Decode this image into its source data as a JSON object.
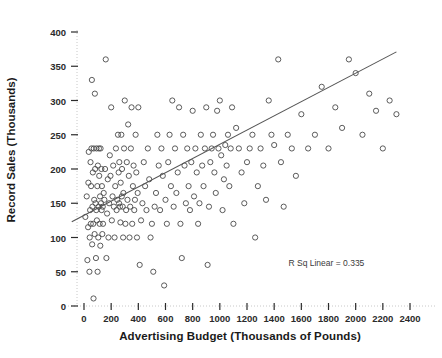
{
  "chart_data": {
    "type": "scatter",
    "title": "",
    "xlabel": "Advertising Budget (Thousands of Pounds)",
    "ylabel": "Record Sales (Thousands)",
    "xlim": [
      -120,
      2520
    ],
    "ylim": [
      -12,
      425
    ],
    "xticks": [
      0,
      200,
      400,
      600,
      800,
      1000,
      1200,
      1400,
      1600,
      1800,
      2000,
      2200,
      2400
    ],
    "yticks": [
      0,
      50,
      100,
      150,
      200,
      250,
      300,
      350,
      400
    ],
    "xtick_labels": [
      "0",
      "200",
      "400",
      "600",
      "800",
      "1000",
      "1200",
      "1400",
      "1600",
      "1800",
      "2000",
      "2200",
      "2400"
    ],
    "ytick_labels": [
      "0",
      "50",
      "100",
      "150",
      "200",
      "250",
      "300",
      "350",
      "400"
    ],
    "grid": false,
    "axis_line_style": "dotted",
    "legend": "none",
    "marker": "open-circle",
    "marker_color": "#4a4a4a",
    "marker_size": 4,
    "annotations": [
      {
        "text": "R Sq Linear = 0.335",
        "x": 1800,
        "y": 62
      }
    ],
    "fit_line": {
      "type": "linear",
      "r_squared": 0.335,
      "intercept": 134,
      "slope": 0.096,
      "x_start": -90,
      "y_start": 123,
      "x_end": 2300,
      "y_end": 371,
      "color": "#555555"
    },
    "points": [
      [
        10,
        130
      ],
      [
        20,
        160
      ],
      [
        25,
        67
      ],
      [
        30,
        115
      ],
      [
        32,
        180
      ],
      [
        35,
        225
      ],
      [
        40,
        50
      ],
      [
        42,
        100
      ],
      [
        45,
        140
      ],
      [
        48,
        210
      ],
      [
        50,
        120
      ],
      [
        52,
        175
      ],
      [
        55,
        230
      ],
      [
        58,
        330
      ],
      [
        60,
        90
      ],
      [
        62,
        145
      ],
      [
        65,
        195
      ],
      [
        68,
        120
      ],
      [
        70,
        11
      ],
      [
        72,
        230
      ],
      [
        75,
        155
      ],
      [
        78,
        105
      ],
      [
        80,
        310
      ],
      [
        82,
        200
      ],
      [
        85,
        150
      ],
      [
        88,
        70
      ],
      [
        90,
        140
      ],
      [
        92,
        230
      ],
      [
        95,
        125
      ],
      [
        98,
        175
      ],
      [
        100,
        50
      ],
      [
        102,
        205
      ],
      [
        105,
        100
      ],
      [
        108,
        145
      ],
      [
        110,
        230
      ],
      [
        112,
        190
      ],
      [
        115,
        120
      ],
      [
        118,
        160
      ],
      [
        120,
        88
      ],
      [
        122,
        230
      ],
      [
        125,
        150
      ],
      [
        128,
        200
      ],
      [
        130,
        140
      ],
      [
        132,
        175
      ],
      [
        135,
        105
      ],
      [
        138,
        145
      ],
      [
        140,
        120
      ],
      [
        145,
        165
      ],
      [
        150,
        155
      ],
      [
        155,
        200
      ],
      [
        160,
        360
      ],
      [
        165,
        70
      ],
      [
        170,
        135
      ],
      [
        175,
        185
      ],
      [
        180,
        100
      ],
      [
        185,
        150
      ],
      [
        190,
        220
      ],
      [
        195,
        190
      ],
      [
        200,
        290
      ],
      [
        205,
        125
      ],
      [
        210,
        160
      ],
      [
        215,
        205
      ],
      [
        220,
        145
      ],
      [
        225,
        100
      ],
      [
        230,
        175
      ],
      [
        235,
        230
      ],
      [
        240,
        140
      ],
      [
        245,
        155
      ],
      [
        250,
        250
      ],
      [
        255,
        195
      ],
      [
        258,
        150
      ],
      [
        260,
        210
      ],
      [
        265,
        145
      ],
      [
        268,
        122
      ],
      [
        270,
        180
      ],
      [
        275,
        250
      ],
      [
        278,
        160
      ],
      [
        280,
        200
      ],
      [
        285,
        145
      ],
      [
        288,
        100
      ],
      [
        290,
        165
      ],
      [
        295,
        230
      ],
      [
        300,
        300
      ],
      [
        305,
        120
      ],
      [
        310,
        140
      ],
      [
        315,
        210
      ],
      [
        320,
        155
      ],
      [
        325,
        265
      ],
      [
        330,
        190
      ],
      [
        335,
        100
      ],
      [
        340,
        145
      ],
      [
        345,
        230
      ],
      [
        350,
        290
      ],
      [
        355,
        120
      ],
      [
        360,
        175
      ],
      [
        365,
        205
      ],
      [
        370,
        140
      ],
      [
        375,
        155
      ],
      [
        380,
        250
      ],
      [
        385,
        195
      ],
      [
        390,
        100
      ],
      [
        395,
        165
      ],
      [
        400,
        290
      ],
      [
        410,
        60
      ],
      [
        420,
        125
      ],
      [
        430,
        150
      ],
      [
        440,
        210
      ],
      [
        450,
        175
      ],
      [
        460,
        140
      ],
      [
        470,
        230
      ],
      [
        480,
        185
      ],
      [
        490,
        100
      ],
      [
        500,
        120
      ],
      [
        510,
        50
      ],
      [
        520,
        145
      ],
      [
        530,
        165
      ],
      [
        540,
        250
      ],
      [
        550,
        205
      ],
      [
        560,
        140
      ],
      [
        570,
        230
      ],
      [
        580,
        190
      ],
      [
        590,
        30
      ],
      [
        600,
        155
      ],
      [
        610,
        120
      ],
      [
        620,
        210
      ],
      [
        630,
        250
      ],
      [
        640,
        175
      ],
      [
        650,
        300
      ],
      [
        660,
        145
      ],
      [
        670,
        230
      ],
      [
        680,
        165
      ],
      [
        690,
        195
      ],
      [
        700,
        290
      ],
      [
        710,
        120
      ],
      [
        720,
        70
      ],
      [
        730,
        250
      ],
      [
        740,
        205
      ],
      [
        750,
        150
      ],
      [
        760,
        230
      ],
      [
        770,
        175
      ],
      [
        780,
        140
      ],
      [
        790,
        210
      ],
      [
        800,
        285
      ],
      [
        810,
        160
      ],
      [
        820,
        230
      ],
      [
        830,
        195
      ],
      [
        840,
        120
      ],
      [
        850,
        150
      ],
      [
        860,
        250
      ],
      [
        870,
        205
      ],
      [
        880,
        175
      ],
      [
        890,
        230
      ],
      [
        900,
        290
      ],
      [
        910,
        60
      ],
      [
        920,
        145
      ],
      [
        930,
        210
      ],
      [
        940,
        230
      ],
      [
        950,
        250
      ],
      [
        960,
        195
      ],
      [
        970,
        165
      ],
      [
        980,
        285
      ],
      [
        990,
        230
      ],
      [
        1000,
        300
      ],
      [
        1010,
        220
      ],
      [
        1020,
        140
      ],
      [
        1030,
        185
      ],
      [
        1040,
        235
      ],
      [
        1050,
        205
      ],
      [
        1060,
        250
      ],
      [
        1070,
        175
      ],
      [
        1080,
        230
      ],
      [
        1090,
        290
      ],
      [
        1100,
        120
      ],
      [
        1120,
        260
      ],
      [
        1140,
        230
      ],
      [
        1160,
        195
      ],
      [
        1180,
        150
      ],
      [
        1200,
        210
      ],
      [
        1220,
        230
      ],
      [
        1240,
        250
      ],
      [
        1260,
        100
      ],
      [
        1280,
        175
      ],
      [
        1300,
        230
      ],
      [
        1320,
        205
      ],
      [
        1340,
        155
      ],
      [
        1360,
        300
      ],
      [
        1380,
        250
      ],
      [
        1400,
        235
      ],
      [
        1430,
        360
      ],
      [
        1450,
        210
      ],
      [
        1470,
        145
      ],
      [
        1500,
        250
      ],
      [
        1530,
        230
      ],
      [
        1560,
        190
      ],
      [
        1600,
        280
      ],
      [
        1650,
        230
      ],
      [
        1700,
        250
      ],
      [
        1750,
        320
      ],
      [
        1800,
        230
      ],
      [
        1850,
        290
      ],
      [
        1900,
        260
      ],
      [
        1950,
        360
      ],
      [
        2000,
        340
      ],
      [
        2050,
        250
      ],
      [
        2100,
        310
      ],
      [
        2150,
        285
      ],
      [
        2200,
        230
      ],
      [
        2250,
        300
      ],
      [
        2300,
        280
      ]
    ]
  }
}
